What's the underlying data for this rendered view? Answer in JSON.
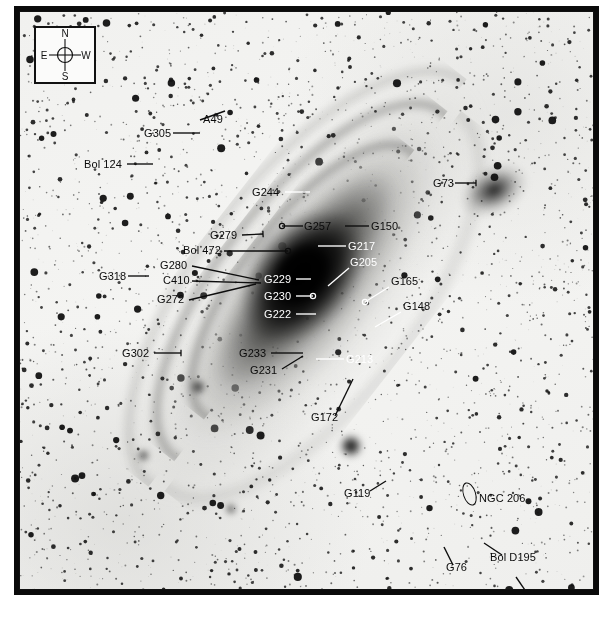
{
  "figure": {
    "type": "annotated-astronomical-image"
  },
  "compass": {
    "north": "N",
    "south": "S",
    "east": "E",
    "west": "W"
  },
  "colors": {
    "frame": "#0a0a0a",
    "sky": "#f2f2f0",
    "label_dark": "#0b0b0b",
    "label_light": "#ffffff"
  },
  "labels": [
    {
      "id": "a49",
      "text": "A49",
      "tone": "dark",
      "x": 183,
      "y": 110,
      "anchor": "start"
    },
    {
      "id": "g305",
      "text": "G305",
      "tone": "dark",
      "x": 124,
      "y": 124,
      "anchor": "start"
    },
    {
      "id": "bol124",
      "text": "Bol 124",
      "tone": "dark",
      "x": 64,
      "y": 155,
      "anchor": "start"
    },
    {
      "id": "g73",
      "text": "G73",
      "tone": "dark",
      "x": 413,
      "y": 174,
      "anchor": "start"
    },
    {
      "id": "g244",
      "text": "G244",
      "tone": "dark",
      "x": 232,
      "y": 183,
      "anchor": "start"
    },
    {
      "id": "g257",
      "text": "G257",
      "tone": "dark",
      "x": 284,
      "y": 217,
      "anchor": "start"
    },
    {
      "id": "g150",
      "text": "G150",
      "tone": "dark",
      "x": 351,
      "y": 217,
      "anchor": "start"
    },
    {
      "id": "g279",
      "text": "G279",
      "tone": "dark",
      "x": 190,
      "y": 226,
      "anchor": "start"
    },
    {
      "id": "g217",
      "text": "G217",
      "tone": "light",
      "x": 328,
      "y": 237,
      "anchor": "start"
    },
    {
      "id": "bol472",
      "text": "Bol 472",
      "tone": "dark",
      "x": 163,
      "y": 241,
      "anchor": "start"
    },
    {
      "id": "g205",
      "text": "G205",
      "tone": "light",
      "x": 330,
      "y": 253,
      "anchor": "start"
    },
    {
      "id": "g280",
      "text": "G280",
      "tone": "dark",
      "x": 140,
      "y": 256,
      "anchor": "start"
    },
    {
      "id": "g318",
      "text": "G318",
      "tone": "dark",
      "x": 79,
      "y": 267,
      "anchor": "start"
    },
    {
      "id": "g229",
      "text": "G229",
      "tone": "light",
      "x": 244,
      "y": 270,
      "anchor": "start"
    },
    {
      "id": "c410",
      "text": "C410",
      "tone": "dark",
      "x": 143,
      "y": 271,
      "anchor": "start"
    },
    {
      "id": "g165",
      "text": "G165",
      "tone": "dark",
      "x": 371,
      "y": 272,
      "anchor": "start"
    },
    {
      "id": "g230",
      "text": "G230",
      "tone": "light",
      "x": 244,
      "y": 287,
      "anchor": "start"
    },
    {
      "id": "g272",
      "text": "G272",
      "tone": "dark",
      "x": 137,
      "y": 290,
      "anchor": "start"
    },
    {
      "id": "g148",
      "text": "G148",
      "tone": "dark",
      "x": 383,
      "y": 297,
      "anchor": "start"
    },
    {
      "id": "g222",
      "text": "G222",
      "tone": "light",
      "x": 244,
      "y": 305,
      "anchor": "start"
    },
    {
      "id": "g233",
      "text": "G233",
      "tone": "dark",
      "x": 219,
      "y": 344,
      "anchor": "start"
    },
    {
      "id": "g302",
      "text": "G302",
      "tone": "dark",
      "x": 102,
      "y": 344,
      "anchor": "start"
    },
    {
      "id": "g213",
      "text": "G213",
      "tone": "light",
      "x": 326,
      "y": 350,
      "anchor": "start"
    },
    {
      "id": "g231",
      "text": "G231",
      "tone": "dark",
      "x": 230,
      "y": 361,
      "anchor": "start"
    },
    {
      "id": "g172",
      "text": "G172",
      "tone": "dark",
      "x": 291,
      "y": 408,
      "anchor": "start"
    },
    {
      "id": "g119",
      "text": "G119",
      "tone": "dark",
      "x": 324,
      "y": 484,
      "anchor": "start"
    },
    {
      "id": "ngc206",
      "text": "NGC 206",
      "tone": "dark",
      "x": 459,
      "y": 489,
      "anchor": "start"
    },
    {
      "id": "bold195",
      "text": "Bol D195",
      "tone": "dark",
      "x": 470,
      "y": 548,
      "anchor": "start"
    },
    {
      "id": "g76",
      "text": "G76",
      "tone": "dark",
      "x": 426,
      "y": 558,
      "anchor": "start"
    },
    {
      "id": "g33",
      "text": "G33",
      "tone": "dark",
      "x": 509,
      "y": 586,
      "anchor": "start"
    }
  ],
  "leaders": [
    {
      "id": "a49",
      "tone": "dark",
      "x1": 180,
      "y1": 108,
      "x2": 205,
      "y2": 99,
      "marker": "none"
    },
    {
      "id": "g305",
      "tone": "dark",
      "x1": 153,
      "y1": 121,
      "x2": 180,
      "y2": 121,
      "marker": "none"
    },
    {
      "id": "bol124",
      "tone": "dark",
      "x1": 107,
      "y1": 152,
      "x2": 133,
      "y2": 152,
      "marker": "none"
    },
    {
      "id": "g73",
      "tone": "dark",
      "x1": 435,
      "y1": 171,
      "x2": 456,
      "y2": 171,
      "marker": "tick"
    },
    {
      "id": "g244",
      "tone": "light",
      "x1": 265,
      "y1": 180,
      "x2": 290,
      "y2": 180,
      "marker": "none"
    },
    {
      "id": "g257",
      "tone": "dark",
      "x1": 283,
      "y1": 214,
      "x2": 262,
      "y2": 214,
      "marker": "circle"
    },
    {
      "id": "g150",
      "tone": "dark",
      "x1": 349,
      "y1": 214,
      "x2": 325,
      "y2": 214,
      "marker": "none"
    },
    {
      "id": "g279",
      "tone": "dark",
      "x1": 222,
      "y1": 223,
      "x2": 243,
      "y2": 222,
      "marker": "tick"
    },
    {
      "id": "g217",
      "tone": "light",
      "x1": 326,
      "y1": 234,
      "x2": 298,
      "y2": 234,
      "marker": "none"
    },
    {
      "id": "bol472",
      "tone": "dark",
      "x1": 204,
      "y1": 239,
      "x2": 268,
      "y2": 239,
      "marker": "circle"
    },
    {
      "id": "g205",
      "tone": "light",
      "x1": 329,
      "y1": 256,
      "x2": 308,
      "y2": 274,
      "marker": "none"
    },
    {
      "id": "g280",
      "tone": "dark",
      "x1": 172,
      "y1": 254,
      "x2": 239,
      "y2": 268,
      "marker": "none"
    },
    {
      "id": "g318",
      "tone": "dark",
      "x1": 108,
      "y1": 264,
      "x2": 129,
      "y2": 264,
      "marker": "none"
    },
    {
      "id": "g229",
      "tone": "light",
      "x1": 276,
      "y1": 267,
      "x2": 291,
      "y2": 267,
      "marker": "none"
    },
    {
      "id": "c410",
      "tone": "dark",
      "x1": 172,
      "y1": 269,
      "x2": 241,
      "y2": 271,
      "marker": "none"
    },
    {
      "id": "g165",
      "tone": "light",
      "x1": 369,
      "y1": 275,
      "x2": 345,
      "y2": 290,
      "marker": "circle"
    },
    {
      "id": "g230",
      "tone": "light",
      "x1": 276,
      "y1": 284,
      "x2": 293,
      "y2": 284,
      "marker": "circle"
    },
    {
      "id": "g272",
      "tone": "dark",
      "x1": 169,
      "y1": 288,
      "x2": 236,
      "y2": 272,
      "marker": "none"
    },
    {
      "id": "g148",
      "tone": "light",
      "x1": 381,
      "y1": 300,
      "x2": 355,
      "y2": 315,
      "marker": "none"
    },
    {
      "id": "g222",
      "tone": "light",
      "x1": 276,
      "y1": 302,
      "x2": 296,
      "y2": 302,
      "marker": "none"
    },
    {
      "id": "g233",
      "tone": "dark",
      "x1": 251,
      "y1": 341,
      "x2": 283,
      "y2": 341,
      "marker": "none"
    },
    {
      "id": "g302",
      "tone": "dark",
      "x1": 134,
      "y1": 341,
      "x2": 161,
      "y2": 341,
      "marker": "tick"
    },
    {
      "id": "g213",
      "tone": "light",
      "x1": 324,
      "y1": 347,
      "x2": 296,
      "y2": 347,
      "marker": "none"
    },
    {
      "id": "g231",
      "tone": "dark",
      "x1": 262,
      "y1": 357,
      "x2": 283,
      "y2": 344,
      "marker": "none"
    },
    {
      "id": "g172",
      "tone": "dark",
      "x1": 315,
      "y1": 404,
      "x2": 333,
      "y2": 367,
      "marker": "none"
    },
    {
      "id": "g119",
      "tone": "dark",
      "x1": 350,
      "y1": 479,
      "x2": 366,
      "y2": 469,
      "marker": "none"
    },
    {
      "id": "bold195",
      "tone": "dark",
      "x1": 482,
      "y1": 543,
      "x2": 464,
      "y2": 531,
      "marker": "none"
    },
    {
      "id": "g76",
      "tone": "dark",
      "x1": 433,
      "y1": 553,
      "x2": 424,
      "y2": 535,
      "marker": "none"
    },
    {
      "id": "g33",
      "tone": "dark",
      "x1": 507,
      "y1": 581,
      "x2": 496,
      "y2": 565,
      "marker": "none"
    }
  ],
  "markers": {
    "ngc206_ellipse": "open-ellipse"
  }
}
